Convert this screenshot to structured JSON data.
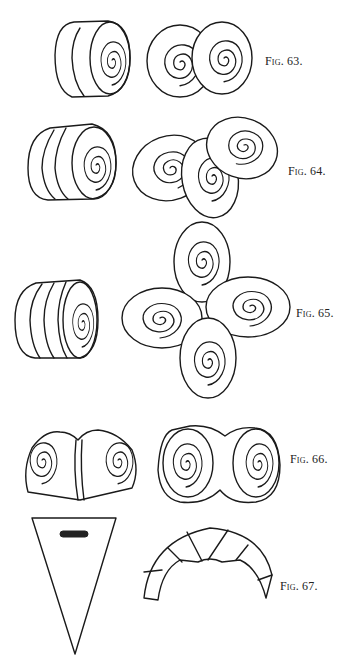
{
  "figures": [
    {
      "id": "fig-63",
      "label": "Fig. 63.",
      "description": "Rolled dough cylinder and two cut spiral rounds overlapping"
    },
    {
      "id": "fig-64",
      "label": "Fig. 64.",
      "description": "Longer rolled dough cylinder and three overlapping spiral slices"
    },
    {
      "id": "fig-65",
      "label": "Fig. 65.",
      "description": "Rolled dough cylinder and four spiral slices arranged in a cross"
    },
    {
      "id": "fig-66",
      "label": "Fig. 66.",
      "description": "Dough folded into double spiral, pinched, and shaped double scroll bun"
    },
    {
      "id": "fig-67",
      "label": "Fig. 67.",
      "description": "Triangular dough piece and rolled crescent"
    }
  ],
  "colors": {
    "ink": "#1a1a1a",
    "paper": "#ffffff"
  }
}
